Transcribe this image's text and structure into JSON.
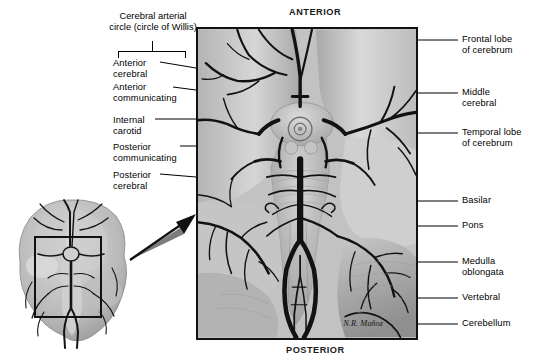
{
  "figure": {
    "signature": "N.R. Muñoz",
    "view_type": "inferior (ventral) view",
    "style": "grayscale medical illustration"
  },
  "orientation": {
    "top": "ANTERIOR",
    "bottom": "POSTERIOR"
  },
  "group_label": {
    "text": "Cerebral arterial\ncircle (circle of Willis)",
    "bracket": "spans the five left-hand arterial labels"
  },
  "labels_left": [
    {
      "id": "anterior-cerebral",
      "text": "Anterior\ncerebral"
    },
    {
      "id": "anterior-communicating",
      "text": "Anterior\ncommunicating"
    },
    {
      "id": "internal-carotid",
      "text": "Internal\ncarotid"
    },
    {
      "id": "posterior-communicating",
      "text": "Posterior\ncommunicating"
    },
    {
      "id": "posterior-cerebral",
      "text": "Posterior\ncerebral"
    }
  ],
  "labels_right": [
    {
      "id": "frontal-lobe",
      "text": "Frontal lobe\nof cerebrum"
    },
    {
      "id": "middle-cerebral",
      "text": "Middle\ncerebral"
    },
    {
      "id": "temporal-lobe",
      "text": "Temporal lobe\nof cerebrum"
    },
    {
      "id": "basilar",
      "text": "Basilar"
    },
    {
      "id": "pons",
      "text": "Pons"
    },
    {
      "id": "medulla-oblongata",
      "text": "Medulla\noblongata"
    },
    {
      "id": "vertebral",
      "text": "Vertebral"
    },
    {
      "id": "cerebellum",
      "text": "Cerebellum"
    }
  ],
  "inset": {
    "description": "Small inferior view of whole brain with a rectangular region-of-interest box",
    "roi_box": "rectangle over midline arteries",
    "arrow": "points from the boxed region up-right to the enlarged main panel"
  },
  "colors": {
    "background": "#ffffff",
    "panel_border": "#111111",
    "artery": "#141414",
    "tissue_light": "#dedede",
    "tissue_mid": "#b9b9b9",
    "tissue_dark": "#8e8e8e",
    "text": "#000000"
  }
}
